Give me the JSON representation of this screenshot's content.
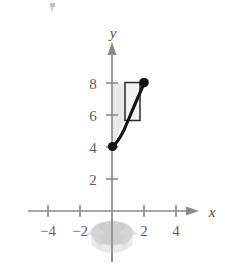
{
  "figure": {
    "axes": {
      "x_label": "x",
      "y_label": "y",
      "x_ticks": [
        {
          "value": -4,
          "label": "−4"
        },
        {
          "value": -2,
          "label": "−2"
        },
        {
          "value": 2,
          "label": "2"
        },
        {
          "value": 4,
          "label": "4"
        }
      ],
      "y_ticks": [
        {
          "value": 2,
          "label": "2"
        },
        {
          "value": 4,
          "label": "4"
        },
        {
          "value": 6,
          "label": "6"
        },
        {
          "value": 8,
          "label": "8"
        }
      ],
      "x_range": [
        -5.2,
        5.4
      ],
      "y_range": [
        -1.6,
        9.6
      ],
      "origin_px": [
        112,
        211
      ],
      "unit_px": 16,
      "axis_color": "#8a8a8a",
      "label_color": "#5f5f5f"
    },
    "curve": {
      "description": "increasing concave-up curve",
      "start_point": {
        "x": 0,
        "y": 4
      },
      "end_point": {
        "x": 2,
        "y": 8
      },
      "points": [
        {
          "x": 0.0,
          "y": 4.0
        },
        {
          "x": 0.25,
          "y": 4.2
        },
        {
          "x": 0.5,
          "y": 4.55
        },
        {
          "x": 0.75,
          "y": 5.05
        },
        {
          "x": 1.0,
          "y": 5.6
        },
        {
          "x": 1.25,
          "y": 6.25
        },
        {
          "x": 1.5,
          "y": 6.9
        },
        {
          "x": 1.75,
          "y": 7.5
        },
        {
          "x": 2.0,
          "y": 8.0
        }
      ],
      "color": "#141414",
      "endpoint_style": "filled-dot"
    },
    "region": {
      "description": "shaded region bounded left by the y-axis, above by y = 8, and right/below by the curve",
      "top_boundary": 8,
      "left_boundary": 0,
      "fill_color": "#e9e9e9"
    },
    "shell_rectangle": {
      "description": "representative vertical rectangle (cylindrical shell element)",
      "x_left": 0.8,
      "x_right": 1.75,
      "y_top": 8.0,
      "y_bottom": 5.7,
      "fill_color": "#f2f2f2",
      "stroke_color": "#2a2a2a"
    },
    "rotation_indicator": {
      "description": "gray elliptical arrow around the y-axis indicating revolution about the y-axis",
      "axis_of_revolution": "y-axis",
      "center_x": 0,
      "center_y": -1.1,
      "color": "#d6d6d6"
    }
  }
}
